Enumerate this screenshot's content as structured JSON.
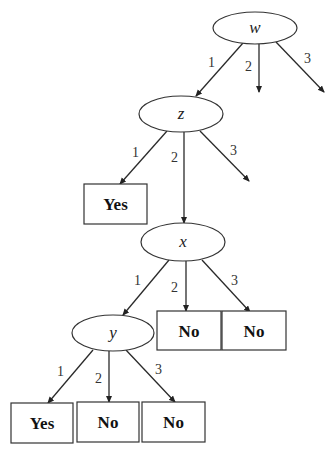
{
  "diagram": {
    "type": "decision-tree",
    "nodes": {
      "w": {
        "label": "w",
        "cx": 255,
        "cy": 28,
        "rx": 42,
        "ry": 16
      },
      "z": {
        "label": "z",
        "cx": 181,
        "cy": 114,
        "rx": 42,
        "ry": 18
      },
      "x": {
        "label": "x",
        "cx": 183,
        "cy": 242,
        "rx": 42,
        "ry": 19
      },
      "y": {
        "label": "y",
        "cx": 113,
        "cy": 333,
        "rx": 41,
        "ry": 18
      }
    },
    "leaves": [
      {
        "id": "leaf-z1",
        "label": "Yes",
        "x": 84,
        "y": 184,
        "w": 63,
        "h": 40
      },
      {
        "id": "leaf-x2",
        "label": "No",
        "x": 157,
        "y": 311,
        "w": 64,
        "h": 39
      },
      {
        "id": "leaf-x3",
        "label": "No",
        "x": 222,
        "y": 311,
        "w": 64,
        "h": 39
      },
      {
        "id": "leaf-y1",
        "label": "Yes",
        "x": 11,
        "y": 403,
        "w": 62,
        "h": 40
      },
      {
        "id": "leaf-y2",
        "label": "No",
        "x": 77,
        "y": 402,
        "w": 62,
        "h": 40
      },
      {
        "id": "leaf-y3",
        "label": "No",
        "x": 142,
        "y": 402,
        "w": 63,
        "h": 40
      }
    ],
    "edges": [
      {
        "from": "w",
        "to": "z",
        "label": "1",
        "x1": 243,
        "y1": 43,
        "x2": 196,
        "y2": 96,
        "lx": 208,
        "ly": 67
      },
      {
        "from": "w",
        "to": "(open)",
        "label": "2",
        "x1": 259,
        "y1": 44,
        "x2": 259,
        "y2": 92,
        "lx": 245,
        "ly": 71
      },
      {
        "from": "w",
        "to": "(open)",
        "label": "3",
        "x1": 276,
        "y1": 42,
        "x2": 324,
        "y2": 92,
        "lx": 304,
        "ly": 63
      },
      {
        "from": "z",
        "to": "leaf-z1",
        "label": "1",
        "x1": 167,
        "y1": 131,
        "x2": 120,
        "y2": 184,
        "lx": 132,
        "ly": 157
      },
      {
        "from": "z",
        "to": "x",
        "label": "2",
        "x1": 184,
        "y1": 132,
        "x2": 184,
        "y2": 223,
        "lx": 171,
        "ly": 162
      },
      {
        "from": "z",
        "to": "(open)",
        "label": "3",
        "x1": 200,
        "y1": 131,
        "x2": 249,
        "y2": 181,
        "lx": 230,
        "ly": 155
      },
      {
        "from": "x",
        "to": "y",
        "label": "1",
        "x1": 169,
        "y1": 260,
        "x2": 123,
        "y2": 315,
        "lx": 134,
        "ly": 285
      },
      {
        "from": "x",
        "to": "leaf-x2",
        "label": "2",
        "x1": 186,
        "y1": 261,
        "x2": 186,
        "y2": 311,
        "lx": 171,
        "ly": 292
      },
      {
        "from": "x",
        "to": "leaf-x3",
        "label": "3",
        "x1": 202,
        "y1": 260,
        "x2": 250,
        "y2": 312,
        "lx": 231,
        "ly": 285
      },
      {
        "from": "y",
        "to": "leaf-y1",
        "label": "1",
        "x1": 93,
        "y1": 350,
        "x2": 48,
        "y2": 403,
        "lx": 57,
        "ly": 376
      },
      {
        "from": "y",
        "to": "leaf-y2",
        "label": "2",
        "x1": 109,
        "y1": 351,
        "x2": 109,
        "y2": 402,
        "lx": 95,
        "ly": 383
      },
      {
        "from": "y",
        "to": "leaf-y3",
        "label": "3",
        "x1": 126,
        "y1": 350,
        "x2": 175,
        "y2": 402,
        "lx": 155,
        "ly": 374
      }
    ]
  },
  "colors": {
    "stroke": "#333333",
    "background": "#ffffff",
    "text": "#222222"
  }
}
